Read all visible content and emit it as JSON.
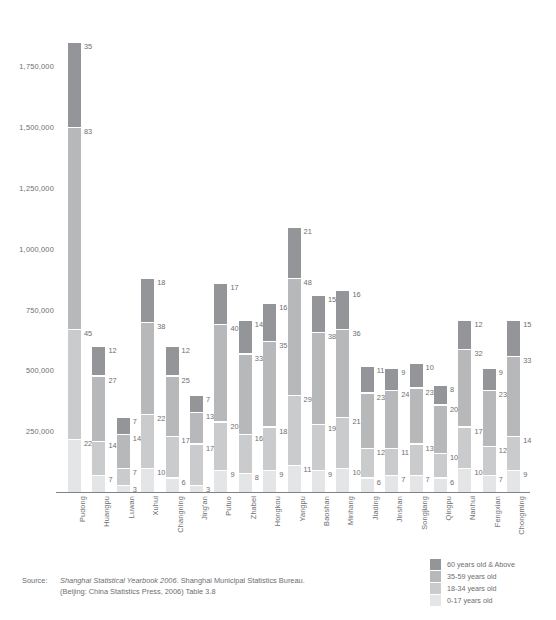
{
  "chart_data": {
    "type": "bar",
    "subtype": "stacked-bar",
    "title": "",
    "xlabel": "",
    "ylabel": "",
    "ylim": [
      0,
      1900000
    ],
    "grid": false,
    "legend_position": "bottom-right",
    "y_ticks": [
      "250,000",
      "500,000",
      "750,000",
      "1,000,000",
      "1,250,000",
      "1,500,000",
      "1,750,000"
    ],
    "y_tick_values": [
      250000,
      500000,
      750000,
      1000000,
      1250000,
      1500000,
      1750000
    ],
    "categories": [
      "Pudong",
      "Huangpu",
      "Luwan",
      "Xuhui",
      "Changning",
      "Jing'an",
      "Putuo",
      "Zhabei",
      "Hongkou",
      "Yangpu",
      "Baoshan",
      "Minhang",
      "Jiading",
      "Jinshan",
      "Songjiang",
      "Qingpu",
      "Nanhui",
      "Fengxian",
      "Chongming"
    ],
    "series": [
      {
        "name": "60 years old & Above",
        "color": "#949599",
        "values": [
          35,
          12,
          7,
          18,
          12,
          7,
          17,
          14,
          16,
          21,
          15,
          16,
          11,
          9,
          10,
          8,
          12,
          9,
          15
        ]
      },
      {
        "name": "35-59 years old",
        "color": "#b6b8ba",
        "values": [
          83,
          27,
          14,
          38,
          25,
          13,
          40,
          33,
          35,
          48,
          38,
          36,
          23,
          24,
          23,
          20,
          32,
          23,
          33
        ]
      },
      {
        "name": "18-34 years old",
        "color": "#c9cbcc",
        "values": [
          45,
          14,
          7,
          22,
          17,
          17,
          20,
          16,
          18,
          29,
          19,
          21,
          12,
          11,
          13,
          10,
          17,
          12,
          14
        ]
      },
      {
        "name": "0-17 years old",
        "color": "#e4e5e6",
        "values": [
          22,
          7,
          3,
          10,
          6,
          3,
          9,
          8,
          9,
          11,
          9,
          10,
          6,
          7,
          7,
          6,
          10,
          7,
          9
        ]
      }
    ],
    "bar_totals": [
      185,
      60,
      31,
      88,
      60,
      40,
      86,
      71,
      78,
      109,
      81,
      83,
      52,
      51,
      53,
      44,
      71,
      51,
      71
    ],
    "value_unit": "ten thousand persons"
  },
  "legend": {
    "items": [
      {
        "label": "60 years old & Above",
        "color": "#949599"
      },
      {
        "label": "35-59 years old",
        "color": "#b6b8ba"
      },
      {
        "label": "18-34 years old",
        "color": "#c9cbcc"
      },
      {
        "label": "0-17 years old",
        "color": "#e4e5e6"
      }
    ]
  },
  "source": {
    "label": "Source:",
    "line1_italic": "Shanghai Statistical Yearbook 2006",
    "line1_rest": ". Shanghai Municipal Statistics Bureau.",
    "line2": "(Beijing: China Statistics Press, 2006) Table 3.8"
  }
}
